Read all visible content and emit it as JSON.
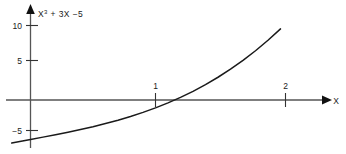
{
  "chart_data": {
    "type": "line",
    "function_expression": "X^3 + 3X - 5",
    "xlabel": "X",
    "ylabel": "",
    "xlim": [
      -0.15,
      2.3
    ],
    "ylim": [
      -6.2,
      12.0
    ],
    "grid": false,
    "legend": null,
    "x_ticks": [
      {
        "value": 1,
        "label": "1"
      },
      {
        "value": 2,
        "label": "2"
      }
    ],
    "y_ticks": [
      {
        "value": 10,
        "label": "10"
      },
      {
        "value": 5,
        "label": "5"
      },
      {
        "value": -5,
        "label": "−5"
      }
    ],
    "x": [
      -0.15,
      0.0,
      0.1,
      0.2,
      0.3,
      0.4,
      0.5,
      0.6,
      0.7,
      0.8,
      0.9,
      1.0,
      1.1,
      1.2,
      1.3,
      1.4,
      1.5,
      1.6,
      1.7,
      1.8,
      1.9,
      2.0
    ],
    "y": [
      -5.45,
      -5.0,
      -4.7,
      -4.39,
      -4.07,
      -3.74,
      -3.38,
      -2.98,
      -2.56,
      -2.09,
      -1.57,
      -1.0,
      -0.37,
      0.33,
      1.1,
      1.94,
      2.88,
      3.9,
      5.01,
      6.23,
      7.56,
      9.0
    ],
    "roots": [
      1.154
    ],
    "y_intercept": -5,
    "curve_color": "#1a1a1a",
    "axis_color": "#555555",
    "series": [
      {
        "name": "X³ + 3X −5",
        "values": [
          -5.45,
          -5.0,
          -4.7,
          -4.39,
          -4.07,
          -3.74,
          -3.38,
          -2.98,
          -2.56,
          -2.09,
          -1.57,
          -1.0,
          -0.37,
          0.33,
          1.1,
          1.94,
          2.88,
          3.9,
          5.01,
          6.23,
          7.56,
          9.0
        ]
      }
    ]
  },
  "labels": {
    "curve_label_base": "X",
    "curve_label_exponent": "3",
    "curve_label_rest": " + 3X −5",
    "x_axis_name": "X",
    "tick_y_10": "10",
    "tick_y_5": "5",
    "tick_y_neg5": "−5",
    "tick_x_1": "1",
    "tick_x_2": "2"
  }
}
